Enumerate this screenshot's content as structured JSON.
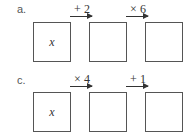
{
  "problems": [
    {
      "label": "a.",
      "start_variable": "x",
      "operations": [
        "+ 2",
        "× 6"
      ],
      "boxes": [
        "x",
        "",
        ""
      ]
    },
    {
      "label": "c.",
      "start_variable": "x",
      "operations": [
        "× 4",
        "+ 1"
      ],
      "boxes": [
        "x",
        "",
        ""
      ]
    }
  ]
}
